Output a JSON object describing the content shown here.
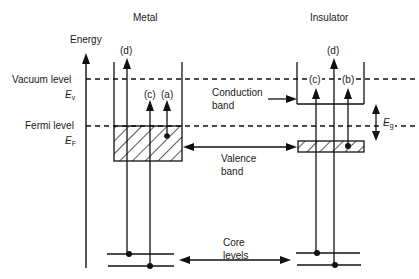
{
  "titles": {
    "metal": "Metal",
    "insulator": "Insulator"
  },
  "axis": {
    "label": "Energy"
  },
  "levels": {
    "vacuum": {
      "label": "Vacuum level",
      "symbol": "E",
      "subscript": "v"
    },
    "fermi": {
      "label": "Fermi level",
      "symbol": "E",
      "subscript": "F"
    }
  },
  "bands": {
    "conduction": {
      "line1": "Conduction",
      "line2": "band"
    },
    "valence": {
      "line1": "Valence",
      "line2": "band"
    },
    "core": {
      "line1": "Core",
      "line2": "levels"
    }
  },
  "gap": {
    "symbol": "E",
    "subscript": "g"
  },
  "transitions": {
    "metal": {
      "a": "(a)",
      "c": "(c)",
      "d": "(d)"
    },
    "insulator": {
      "b": "(b)",
      "c": "(c)",
      "d": "(d)"
    }
  },
  "colors": {
    "ink": "#111111",
    "background": "#ffffff"
  }
}
